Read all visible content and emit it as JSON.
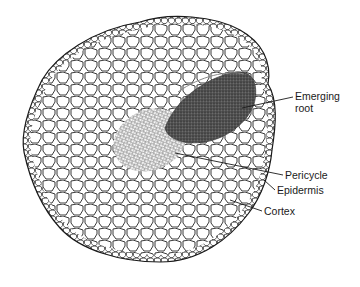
{
  "figure": {
    "outline_color": "#1a1a1a",
    "root_color": "#2a2a2a",
    "background": "#ffffff"
  },
  "labels": [
    {
      "id": "emerging-root",
      "line1": "Emerging",
      "line2": "root",
      "x": 295,
      "y": 92,
      "anchor": [
        242,
        108
      ],
      "tip": [
        293,
        97
      ]
    },
    {
      "id": "pericycle",
      "line1": "Pericycle",
      "x": 285,
      "y": 169,
      "anchor": [
        175,
        153
      ],
      "tip": [
        283,
        175
      ]
    },
    {
      "id": "epidermis",
      "line1": "Epidermis",
      "x": 277,
      "y": 184,
      "anchor": [
        264,
        180
      ],
      "tip": [
        275,
        190
      ]
    },
    {
      "id": "cortex",
      "line1": "Cortex",
      "x": 264,
      "y": 205,
      "anchor": [
        230,
        200
      ],
      "tip": [
        262,
        211
      ]
    }
  ]
}
